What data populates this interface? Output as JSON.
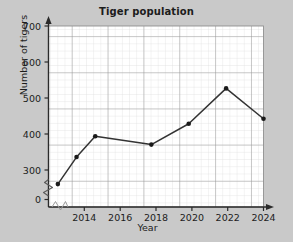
{
  "chart_data": {
    "type": "line",
    "title": "Tiger population",
    "xlabel": "Year",
    "ylabel": "Number of tigers",
    "x": [
      2013,
      2014,
      2015,
      2018,
      2020,
      2022,
      2024
    ],
    "values": [
      335,
      400,
      450,
      430,
      480,
      565,
      492
    ],
    "series": [
      {
        "name": "Tiger population",
        "x": [
          2013,
          2014,
          2015,
          2018,
          2020,
          2022,
          2024
        ],
        "values": [
          335,
          400,
          450,
          430,
          480,
          565,
          492
        ]
      }
    ],
    "xlim": [
      2012.5,
      2024
    ],
    "ylim": [
      280,
      715
    ],
    "ytick_labels": [
      "0",
      "300",
      "400",
      "500",
      "600",
      "700"
    ],
    "ytick_values": [
      0,
      300,
      400,
      500,
      600,
      700
    ],
    "xtick_labels": [
      "2014",
      "2016",
      "2018",
      "2020",
      "2022",
      "2024"
    ],
    "xtick_values": [
      2014,
      2016,
      2018,
      2020,
      2022,
      2024
    ],
    "grid": true,
    "minor_grid": true,
    "legend": false,
    "axis_break_y": true,
    "axis_break_x": true,
    "marker": "filled-dot",
    "line_color": "#333333",
    "marker_color": "#1a1a1a",
    "plot_background": "#ffffff",
    "figure_background": "#c9c9c9",
    "grid_color_minor": "#d9d9d9",
    "grid_color_major": "#8f8f8f"
  },
  "axes": {
    "y_axis_name": "y-axis",
    "x_axis_name": "x-axis"
  }
}
